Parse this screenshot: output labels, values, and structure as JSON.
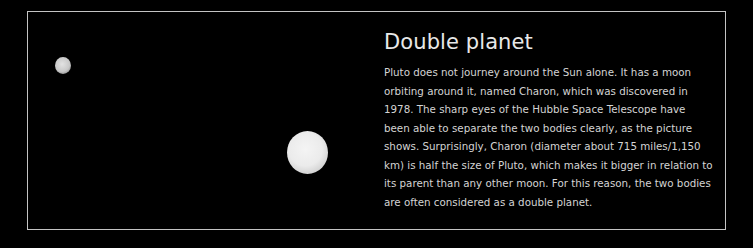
{
  "panel": {
    "title": "Double planet",
    "body": "Pluto does not journey around the Sun alone. It has a moon orbiting around it, named Charon, which was discovered in 1978. The sharp eyes of the Hubble Space Telescope have been able to separate the two bodies clearly, as the picture shows. Surprisingly, Charon (diameter about 715 miles/1,150 km) is half the size of Pluto, which makes it bigger in relation to its parent than any other moon. For this reason, the two bodies are often considered as a double planet."
  },
  "image": {
    "bodies": [
      {
        "name": "Charon",
        "role": "moon"
      },
      {
        "name": "Pluto",
        "role": "planet"
      }
    ]
  },
  "colors": {
    "background": "#000000",
    "frame": "#c4c4c4",
    "title": "#e8e8e8",
    "text": "#d4d4d4"
  }
}
